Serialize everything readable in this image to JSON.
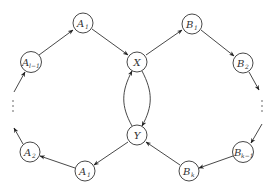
{
  "diagram": {
    "type": "directed-graph",
    "nodes": [
      {
        "id": "X",
        "base": "X",
        "sub": "",
        "x": 137,
        "y": 62
      },
      {
        "id": "Y",
        "base": "Y",
        "sub": "",
        "x": 137,
        "y": 135
      },
      {
        "id": "A1_top",
        "base": "A",
        "sub": "1",
        "x": 83,
        "y": 23
      },
      {
        "id": "Al1",
        "base": "A",
        "sub": "l−1",
        "x": 31,
        "y": 62
      },
      {
        "id": "A2",
        "base": "A",
        "sub": "2",
        "x": 30,
        "y": 152
      },
      {
        "id": "A1_bot",
        "base": "A",
        "sub": "1",
        "x": 85,
        "y": 171
      },
      {
        "id": "B1",
        "base": "B",
        "sub": "1",
        "x": 192,
        "y": 24
      },
      {
        "id": "B2",
        "base": "B",
        "sub": "2",
        "x": 243,
        "y": 63
      },
      {
        "id": "Bk1",
        "base": "B",
        "sub": "k−1",
        "x": 243,
        "y": 152
      },
      {
        "id": "Bk",
        "base": "B",
        "sub": "k",
        "x": 189,
        "y": 171
      }
    ],
    "edges": [
      {
        "from": "Al1",
        "to": "A1_top"
      },
      {
        "from": "A1_top",
        "to": "X"
      },
      {
        "from": "X",
        "to": "B1"
      },
      {
        "from": "B1",
        "to": "B2"
      },
      {
        "from": "B2",
        "to": "dots-right"
      },
      {
        "from": "dots-right",
        "to": "Bk1"
      },
      {
        "from": "Bk1",
        "to": "Bk"
      },
      {
        "from": "Bk",
        "to": "Y"
      },
      {
        "from": "Y",
        "to": "A1_bot"
      },
      {
        "from": "A1_bot",
        "to": "A2"
      },
      {
        "from": "A2",
        "to": "dots-left"
      },
      {
        "from": "dots-left",
        "to": "Al1"
      },
      {
        "from": "X",
        "to": "Y",
        "curve": "right"
      },
      {
        "from": "Y",
        "to": "X",
        "curve": "left"
      }
    ],
    "ellipsis": [
      {
        "id": "dots-left",
        "x": 13,
        "y": 106
      },
      {
        "id": "dots-right",
        "x": 262,
        "y": 106
      }
    ]
  },
  "labels": {
    "X": "X",
    "Y": "Y",
    "A1_top_base": "A",
    "A1_top_sub": "1",
    "Al1_base": "A",
    "Al1_sub": "l−1",
    "A2_base": "A",
    "A2_sub": "2",
    "A1_bot_base": "A",
    "A1_bot_sub": "1",
    "B1_base": "B",
    "B1_sub": "1",
    "B2_base": "B",
    "B2_sub": "2",
    "Bk1_base": "B",
    "Bk1_sub": "k−1",
    "Bk_base": "B",
    "Bk_sub": "k"
  }
}
